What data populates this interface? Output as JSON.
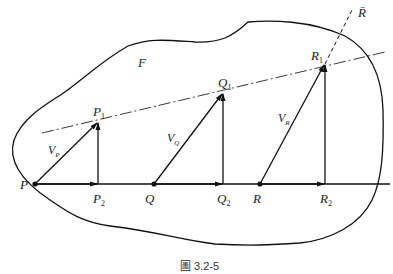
{
  "figure": {
    "caption": "圖 3.2-5",
    "region_label": "F",
    "line_label": "R̄",
    "points": [
      {
        "name": "P",
        "label": "P"
      },
      {
        "name": "Q",
        "label": "Q"
      },
      {
        "name": "R",
        "label": "R"
      }
    ],
    "tips": [
      {
        "name": "P1",
        "label": "P",
        "sub": "1"
      },
      {
        "name": "Q1",
        "label": "Q",
        "sub": "1"
      },
      {
        "name": "R1",
        "label": "R",
        "sub": "1"
      }
    ],
    "feet": [
      {
        "name": "P2",
        "label": "P",
        "sub": "2"
      },
      {
        "name": "Q2",
        "label": "Q",
        "sub": "2"
      },
      {
        "name": "R2",
        "label": "R",
        "sub": "2"
      }
    ],
    "velocities": [
      {
        "name": "VP",
        "label": "V",
        "sub": "P"
      },
      {
        "name": "VQ",
        "label": "V",
        "sub": "Q"
      },
      {
        "name": "VR",
        "label": "V",
        "sub": "R"
      }
    ]
  }
}
